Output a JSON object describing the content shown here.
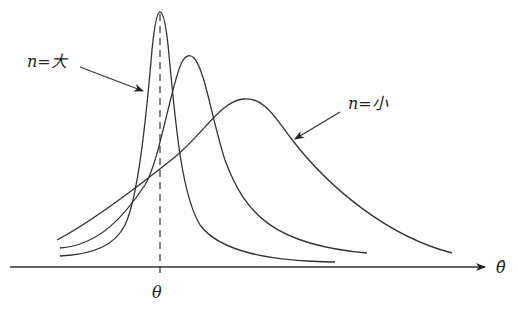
{
  "diagram": {
    "type": "sampling distributions vs sample size",
    "axis": {
      "label": "θ̂",
      "tick_label": "θ"
    },
    "annotations": [
      {
        "text": "n = 大",
        "meaning": "n large",
        "points_to": "tallest narrow curve"
      },
      {
        "text": "n = 小",
        "meaning": "n small",
        "points_to": "widest flat curve"
      }
    ],
    "curves": [
      {
        "name": "large-n",
        "peak_x": 160,
        "peak_y": 12
      },
      {
        "name": "medium-n",
        "peak_x": 190,
        "peak_y": 55
      },
      {
        "name": "small-n",
        "peak_x": 243,
        "peak_y": 99
      }
    ],
    "colors": {
      "line": "#333333",
      "background": "#ffffff"
    }
  },
  "labels": {
    "n_large": "n=大",
    "n_small": "n=小",
    "theta": "θ",
    "theta_hat": "θ̂"
  }
}
